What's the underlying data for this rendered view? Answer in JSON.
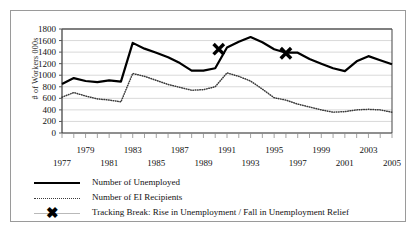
{
  "chart_data": {
    "type": "line",
    "title": "",
    "xlabel": "",
    "ylabel": "# of Workers  000s",
    "ylim": [
      0,
      1800
    ],
    "ytick_step": 200,
    "yticks": [
      0,
      200,
      400,
      600,
      800,
      1000,
      1200,
      1400,
      1600,
      1800
    ],
    "xlim": [
      1977,
      2005
    ],
    "grid": "horizontal",
    "legend_position": "below-plot",
    "x": [
      1977,
      1978,
      1979,
      1980,
      1981,
      1982,
      1983,
      1984,
      1985,
      1986,
      1987,
      1988,
      1989,
      1990,
      1991,
      1992,
      1993,
      1994,
      1995,
      1996,
      1997,
      1998,
      1999,
      2000,
      2001,
      2002,
      2003,
      2004,
      2005
    ],
    "series": [
      {
        "name": "Number of Unemployed",
        "style": "solid",
        "color": "#000000",
        "values": [
          850,
          950,
          900,
          880,
          910,
          890,
          1560,
          1460,
          1390,
          1310,
          1210,
          1080,
          1080,
          1120,
          1480,
          1580,
          1660,
          1570,
          1450,
          1390,
          1390,
          1280,
          1200,
          1120,
          1070,
          1240,
          1330,
          1260,
          1190
        ]
      },
      {
        "name": "Number of EI Recipients",
        "style": "dotted",
        "color": "#3a3a3a",
        "values": [
          620,
          700,
          640,
          590,
          570,
          540,
          1030,
          980,
          910,
          840,
          790,
          740,
          750,
          800,
          1040,
          980,
          900,
          760,
          610,
          570,
          500,
          450,
          400,
          360,
          370,
          400,
          410,
          400,
          360
        ]
      }
    ],
    "markers": [
      {
        "label": "Tracking Break",
        "x": 1990.3,
        "y": 1450
      },
      {
        "label": "Tracking Break",
        "x": 1996.0,
        "y": 1380
      }
    ],
    "xticklabels_top": [
      "1979",
      "1983",
      "1987",
      "1991",
      "1995",
      "1999",
      "2003"
    ],
    "xticklabels_top_x": [
      1979,
      1983,
      1987,
      1991,
      1995,
      1999,
      2003
    ],
    "xticklabels_bottom": [
      "1977",
      "1981",
      "1985",
      "1989",
      "1993",
      "1997",
      "2001",
      "2005"
    ],
    "xticklabels_bottom_x": [
      1977,
      1981,
      1985,
      1989,
      1993,
      1997,
      2001,
      2005
    ]
  },
  "legend": {
    "items": [
      {
        "key": "solid-line-key",
        "label": "Number of Unemployed"
      },
      {
        "key": "dotted-line-key",
        "label": "Number of EI Recipients"
      },
      {
        "key": "x-marker-key",
        "label": "Tracking Break: Rise in Unemployment / Fall in Unemployment Relief"
      }
    ]
  }
}
